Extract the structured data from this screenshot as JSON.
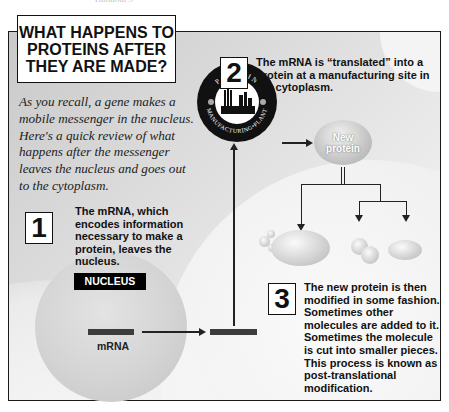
{
  "header_cut_text": "Handout 3",
  "title": "WHAT HAPPENS TO PROTEINS AFTER THEY ARE MADE?",
  "title_lines": [
    "WHAT HAPPENS TO",
    "PROTEINS AFTER",
    "THEY ARE MADE?"
  ],
  "intro": "As you recall, a gene makes a mobile messenger in the nucleus. Here's a quick review of what happens after the messenger leaves the nucleus and goes out to the cytoplasm.",
  "steps": [
    {
      "number": "1",
      "text": "The mRNA, which encodes information necessary to make a protein, leaves the nucleus."
    },
    {
      "number": "2",
      "text": "The mRNA is “translated” into a protein at a manufacturing site in the cytoplasm."
    },
    {
      "number": "3",
      "text": "The new protein is then modified in some fashion. Sometimes other molecules are added to it. Sometimes the molecule is cut into smaller pieces. This process is known as post-translational modification."
    }
  ],
  "labels": {
    "nucleus": "NUCLEUS",
    "mrna": "mRNA",
    "new_protein_line1": "New",
    "new_protein_line2": "protein",
    "plant_top": "PROTEIN",
    "plant_bottom": "MANUFACTURING•PLANT"
  },
  "colors": {
    "frame_border": "#1a1a1a",
    "label_bg": "#000000",
    "label_text": "#ffffff",
    "mrna_bar": "#3c3c3c"
  }
}
